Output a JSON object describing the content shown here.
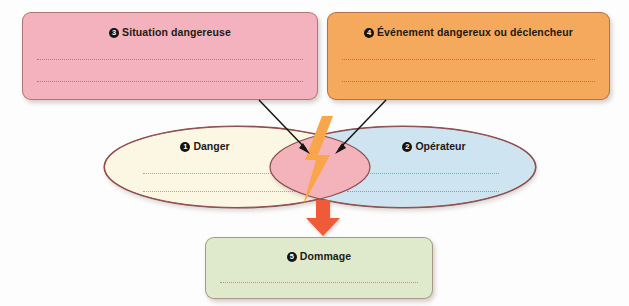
{
  "diagram": {
    "language": "fr",
    "colors": {
      "situation_fill": "#f3b2bd",
      "evenement_fill": "#f4a95d",
      "dommage_fill": "#dfeacd",
      "danger_fill": "#fbf7e3",
      "operateur_fill": "#cee4f0",
      "intersection_fill": "#f4b2bb",
      "ellipse_stroke": "#8d4d4f",
      "bolt_fill": "#f9a64a",
      "arrow_orange": "#ef5a38",
      "arrow_black": "#151515"
    },
    "boxes": {
      "situation": {
        "number": "3",
        "label": "Situation dangereuse",
        "lines": 2
      },
      "evenement": {
        "number": "4",
        "label": "Événement dangereux ou déclencheur",
        "lines": 2
      },
      "dommage": {
        "number": "5",
        "label": "Dommage",
        "lines": 1
      }
    },
    "ellipses": {
      "danger": {
        "number": "1",
        "label": "Danger",
        "lines": 2
      },
      "operateur": {
        "number": "2",
        "label": "Opérateur",
        "lines": 2
      }
    },
    "intersection": {
      "icon": "lightning-bolt-icon",
      "label": ""
    },
    "connectors": [
      {
        "name": "situation-to-intersection",
        "from": "situation",
        "to": "intersection",
        "style": "black-arrow"
      },
      {
        "name": "evenement-to-intersection",
        "from": "evenement",
        "to": "intersection",
        "style": "black-arrow"
      },
      {
        "name": "intersection-to-dommage",
        "from": "intersection",
        "to": "dommage",
        "style": "orange-arrow"
      }
    ]
  }
}
